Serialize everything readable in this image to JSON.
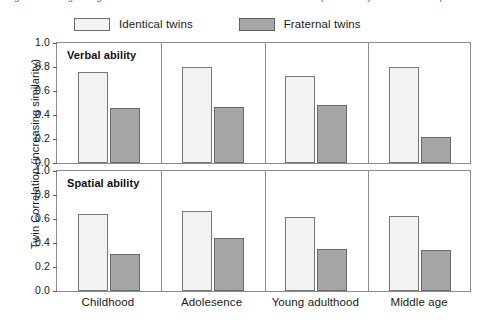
{
  "figure": {
    "caption_sliver": "Figure 1  Changes in genetic and environmental influence on verbal and spatial ability across the lifespan",
    "legend": [
      {
        "label": "Identical twins",
        "key": "identical",
        "color": "#f2f2f2"
      },
      {
        "label": "Fraternal twins",
        "key": "fraternal",
        "color": "#a6a6a6"
      }
    ]
  },
  "chart_data": {
    "type": "bar",
    "title": "",
    "xlabel": "",
    "ylabel": "Twin Correlation (increasing similarity)",
    "ylim": [
      0,
      1.0
    ],
    "ytick_labels": [
      "1.0",
      "0.8",
      "0.6",
      "0.4",
      "0.2",
      "0.0"
    ],
    "ytick_values": [
      1.0,
      0.8,
      0.6,
      0.4,
      0.2,
      0.0
    ],
    "grid": false,
    "legend_position": "top",
    "categories": [
      "Childhood",
      "Adolesence",
      "Young adulthood",
      "Middle age"
    ],
    "panels": [
      {
        "label": "Verbal ability",
        "series": [
          {
            "name": "Identical twins",
            "values": [
              0.755,
              0.8,
              0.725,
              0.8
            ]
          },
          {
            "name": "Fraternal twins",
            "values": [
              0.455,
              0.465,
              0.48,
              0.215
            ]
          }
        ]
      },
      {
        "label": "Spatial ability",
        "series": [
          {
            "name": "Identical twins",
            "values": [
              0.645,
              0.67,
              0.62,
              0.625
            ]
          },
          {
            "name": "Fraternal twins",
            "values": [
              0.305,
              0.445,
              0.35,
              0.34
            ]
          }
        ]
      }
    ]
  }
}
